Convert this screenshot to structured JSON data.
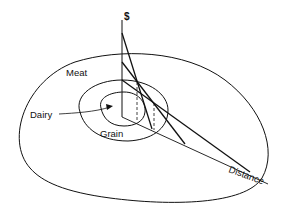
{
  "diagram": {
    "kind": "von Thunen land-use rings with bid-rent curves",
    "axes": {
      "vertical_label": "$",
      "horizontal_label": "Distance"
    },
    "zones": [
      {
        "id": "dairy",
        "label": "Dairy",
        "order": 1
      },
      {
        "id": "grain",
        "label": "Grain",
        "order": 2
      },
      {
        "id": "meat",
        "label": "Meat",
        "order": 3
      }
    ],
    "bid_rent_lines": [
      {
        "zone": "dairy",
        "intercept_rank": 1,
        "slope": "steepest"
      },
      {
        "zone": "grain",
        "intercept_rank": 2,
        "slope": "medium"
      },
      {
        "zone": "meat",
        "intercept_rank": 3,
        "slope": "shallowest"
      }
    ],
    "colors": {
      "line": "#111111",
      "background": "#ffffff"
    }
  }
}
